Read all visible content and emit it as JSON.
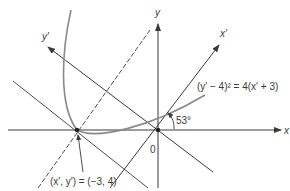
{
  "figure": {
    "axes": {
      "x_label": "x",
      "y_label": "y",
      "x_prime_label": "x′",
      "y_prime_label": "y′",
      "origin_label": "0"
    },
    "angle_label": "53°",
    "equation_label": "(y′ − 4)² = 4(x′ + 3)",
    "vertex_label": "(x′, y′) = (−3, 4)",
    "colors": {
      "lines": "#3a3a3a",
      "curve": "#8a8a8a",
      "background": "#ffffff"
    }
  }
}
